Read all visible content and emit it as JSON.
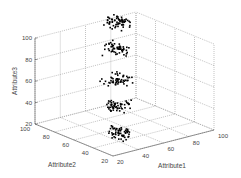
{
  "chart_data": {
    "type": "scatter3d",
    "title": "",
    "xlabel": "Attribute1",
    "ylabel": "Attribute2",
    "zlabel": "Attribute3",
    "xlim": [
      20,
      100
    ],
    "ylim": [
      20,
      100
    ],
    "zlim": [
      20,
      100
    ],
    "x_ticks": [
      "20",
      "40",
      "60",
      "80",
      "100"
    ],
    "y_ticks": [
      "20",
      "40",
      "60",
      "80",
      "100"
    ],
    "z_ticks": [
      "20",
      "40",
      "60",
      "80",
      "100"
    ],
    "grid": true,
    "legend": null,
    "marker_color": "#000000",
    "grid_color": "#9a9a9a",
    "axis_color": "#555555",
    "clusters": [
      {
        "attribute1": 50,
        "attribute2": 53,
        "attribute3": 20,
        "n": 60,
        "spread": 6
      },
      {
        "attribute1": 57,
        "attribute2": 63,
        "attribute3": 40,
        "n": 55,
        "spread": 6
      },
      {
        "attribute1": 62,
        "attribute2": 69,
        "attribute3": 60,
        "n": 55,
        "spread": 6
      },
      {
        "attribute1": 72,
        "attribute2": 82,
        "attribute3": 80,
        "n": 55,
        "spread": 6
      },
      {
        "attribute1": 79,
        "attribute2": 92,
        "attribute3": 100,
        "n": 65,
        "spread": 6
      }
    ]
  },
  "axes": {
    "z_label": "Attribute3",
    "x_label": "Attribute1",
    "y_label": "Attribute2"
  }
}
